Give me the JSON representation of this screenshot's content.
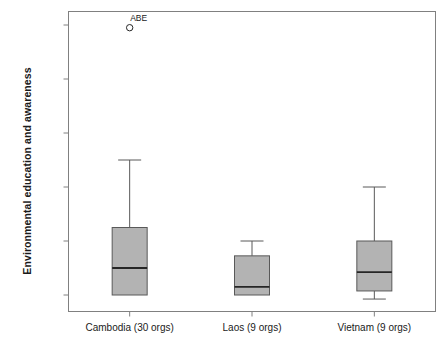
{
  "chart_data": {
    "type": "box",
    "title": "",
    "xlabel": "",
    "ylabel": "Environmental education and awareness",
    "ylim": [
      -7.5,
      105
    ],
    "ytick_values": [
      0,
      20,
      40,
      60,
      80,
      100
    ],
    "ytick_labels": [
      "0.00",
      "20.00",
      "40.00",
      "60.00",
      "80.00",
      "100.00"
    ],
    "grid": false,
    "legend": null,
    "categories": [
      "Cambodia (30 orgs)",
      "Laos (9 orgs)",
      "Vietnam (9 orgs)"
    ],
    "boxes": [
      {
        "category": "Cambodia (30 orgs)",
        "whisker_low": 0.0,
        "q1": 0.0,
        "median": 10.0,
        "q3": 25.0,
        "whisker_high": 50.0,
        "outliers": [
          {
            "value": 99.0,
            "label": "ABE"
          }
        ]
      },
      {
        "category": "Laos (9 orgs)",
        "whisker_low": 0.0,
        "q1": 0.0,
        "median": 3.0,
        "q3": 14.5,
        "whisker_high": 20.0,
        "outliers": []
      },
      {
        "category": "Vietnam (9 orgs)",
        "whisker_low": -1.5,
        "q1": 1.5,
        "median": 8.5,
        "q3": 20.0,
        "whisker_high": 40.0,
        "outliers": []
      }
    ],
    "colors": {
      "box_fill": "#b3b3b3",
      "box_stroke": "#595959",
      "median_stroke": "#262626",
      "whisker_stroke": "#595959",
      "frame_stroke": "#808080",
      "outlier_stroke": "#262626",
      "background": "#ffffff",
      "text": "#1a1a1a"
    }
  }
}
